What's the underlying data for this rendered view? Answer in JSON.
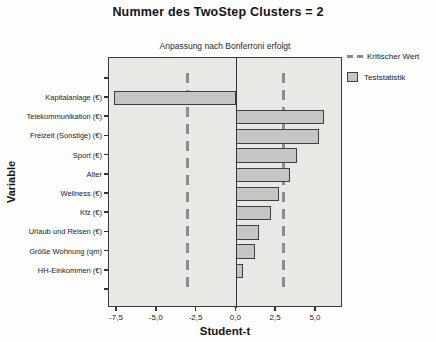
{
  "title": "Nummer des TwoStep Clusters = 2",
  "subtitle": "Anpassung nach Bonferroni erfolgt",
  "colors": {
    "bar_fill": "#c6c5c1",
    "bar_border": "#3f3f3f",
    "plot_background": "#e9e8e5",
    "critical_line": "#8c8c8c",
    "axis": "#333333"
  },
  "legend": {
    "items": [
      {
        "label": "Kritischer Wert",
        "symbol": "dashed-line"
      },
      {
        "label": "Teststatistik",
        "symbol": "bar-swatch"
      }
    ]
  },
  "chart_data": {
    "type": "bar",
    "orientation": "horizontal",
    "title": "Nummer des TwoStep Clusters = 2",
    "subtitle": "Anpassung nach Bonferroni erfolgt",
    "xlabel": "Student-t",
    "ylabel": "Variable",
    "categories": [
      "Kapitalanlage (€)",
      "Telekommunikation (€)",
      "Freizeit (Sonstige) (€)",
      "Sport (€)",
      "Alter",
      "Wellness (€)",
      "Kfz (€)",
      "Urlaub und Reisen (€)",
      "Größe Wohnung (qm)",
      "HH-Einkommen (€)"
    ],
    "values": [
      -7.7,
      5.5,
      5.2,
      3.8,
      3.4,
      2.7,
      2.2,
      1.4,
      1.2,
      0.4
    ],
    "critical_values": [
      -3.0,
      3.0
    ],
    "xlim": [
      -8.0,
      6.7
    ],
    "xticks": [
      -7.5,
      -5.0,
      -2.5,
      0.0,
      2.5,
      5.0
    ],
    "xtick_labels": [
      "-7,5",
      "-5,0",
      "-2,5",
      "0,0",
      "2,5",
      "5,0"
    ],
    "legend": [
      "Kritischer Wert",
      "Teststatistik"
    ],
    "legend_position": "top-right",
    "grid": false
  }
}
